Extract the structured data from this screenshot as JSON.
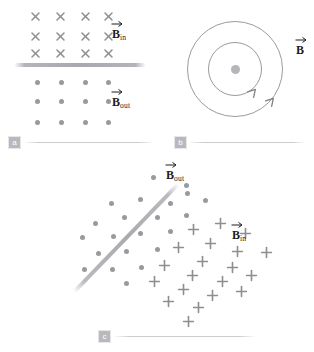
{
  "figure": {
    "marker_color": "#8e8e92",
    "line_color": "#a8a8ae",
    "label_color": "#1d1d1f",
    "badge_color": "#b9b9bd"
  },
  "panels": [
    {
      "id": "a",
      "badge": "a",
      "description": "Uniform field reversing across a horizontal boundary",
      "labels": [
        {
          "symbol": "B",
          "subscript": "in",
          "x": 112,
          "y": 28
        },
        {
          "symbol": "B",
          "subscript": "out",
          "x": 112,
          "y": 96
        }
      ],
      "separator": {
        "x": 14,
        "y": 63,
        "width": 132
      },
      "markers_cross": {
        "kind": "cross",
        "points": [
          {
            "x": 35,
            "y": 16
          },
          {
            "x": 60,
            "y": 16
          },
          {
            "x": 85,
            "y": 16
          },
          {
            "x": 108,
            "y": 16
          },
          {
            "x": 35,
            "y": 36
          },
          {
            "x": 60,
            "y": 36
          },
          {
            "x": 85,
            "y": 36
          },
          {
            "x": 108,
            "y": 36
          },
          {
            "x": 35,
            "y": 53
          },
          {
            "x": 60,
            "y": 53
          },
          {
            "x": 85,
            "y": 53
          },
          {
            "x": 108,
            "y": 53
          }
        ]
      },
      "markers_dot": {
        "kind": "dot",
        "points": [
          {
            "x": 37,
            "y": 82
          },
          {
            "x": 61,
            "y": 82
          },
          {
            "x": 85,
            "y": 82
          },
          {
            "x": 108,
            "y": 82
          },
          {
            "x": 37,
            "y": 101
          },
          {
            "x": 61,
            "y": 101
          },
          {
            "x": 85,
            "y": 101
          },
          {
            "x": 108,
            "y": 101
          },
          {
            "x": 37,
            "y": 122
          },
          {
            "x": 61,
            "y": 122
          },
          {
            "x": 85,
            "y": 122
          },
          {
            "x": 108,
            "y": 122
          }
        ]
      }
    },
    {
      "id": "b",
      "badge": "b",
      "description": "Concentric circular field lines around a current-carrying wire pointing out of the page",
      "labels": [
        {
          "symbol": "B",
          "subscript": "",
          "x": 136,
          "y": 44
        }
      ],
      "rings": [
        {
          "cx": 75,
          "cy": 69,
          "r": 48
        },
        {
          "cx": 75,
          "cy": 69,
          "r": 27
        }
      ],
      "center_dot": {
        "cx": 75,
        "cy": 69
      },
      "arrowheads": [
        {
          "x": 111,
          "y": 101,
          "rotate": -48
        },
        {
          "x": 93,
          "y": 92,
          "rotate": -48
        }
      ]
    },
    {
      "id": "c",
      "badge": "c",
      "description": "Field out of page on one side of a diagonal boundary, into page on the other",
      "labels": [
        {
          "symbol": "B",
          "subscript": "out",
          "x": 126,
          "y": 14
        },
        {
          "symbol": "B",
          "subscript": "in",
          "x": 192,
          "y": 74
        }
      ],
      "separator_diagonal": {
        "x": 34,
        "y": 135,
        "length": 150,
        "angle": -46
      },
      "markers_dot": {
        "kind": "dot",
        "points": [
          {
            "x": 113,
            "y": 22
          },
          {
            "x": 147,
            "y": 38
          },
          {
            "x": 146,
            "y": 30
          },
          {
            "x": 100,
            "y": 44
          },
          {
            "x": 130,
            "y": 48
          },
          {
            "x": 165,
            "y": 45
          },
          {
            "x": 71,
            "y": 48
          },
          {
            "x": 84,
            "y": 62
          },
          {
            "x": 117,
            "y": 62
          },
          {
            "x": 146,
            "y": 60
          },
          {
            "x": 55,
            "y": 68
          },
          {
            "x": 100,
            "y": 78
          },
          {
            "x": 130,
            "y": 76
          },
          {
            "x": 73,
            "y": 81
          },
          {
            "x": 42,
            "y": 82
          },
          {
            "x": 86,
            "y": 96
          },
          {
            "x": 117,
            "y": 94
          },
          {
            "x": 58,
            "y": 98
          },
          {
            "x": 101,
            "y": 112
          },
          {
            "x": 72,
            "y": 114
          },
          {
            "x": 44,
            "y": 114
          },
          {
            "x": 86,
            "y": 128
          }
        ]
      },
      "markers_plus": {
        "kind": "plus",
        "points": [
          {
            "x": 180,
            "y": 68
          },
          {
            "x": 153,
            "y": 74
          },
          {
            "x": 205,
            "y": 78
          },
          {
            "x": 170,
            "y": 88
          },
          {
            "x": 138,
            "y": 92
          },
          {
            "x": 197,
            "y": 96
          },
          {
            "x": 226,
            "y": 97
          },
          {
            "x": 162,
            "y": 106
          },
          {
            "x": 192,
            "y": 112
          },
          {
            "x": 124,
            "y": 110
          },
          {
            "x": 152,
            "y": 120
          },
          {
            "x": 211,
            "y": 120
          },
          {
            "x": 182,
            "y": 126
          },
          {
            "x": 114,
            "y": 126
          },
          {
            "x": 143,
            "y": 134
          },
          {
            "x": 172,
            "y": 140
          },
          {
            "x": 201,
            "y": 136
          },
          {
            "x": 128,
            "y": 146
          },
          {
            "x": 158,
            "y": 152
          },
          {
            "x": 148,
            "y": 166
          }
        ]
      }
    }
  ]
}
